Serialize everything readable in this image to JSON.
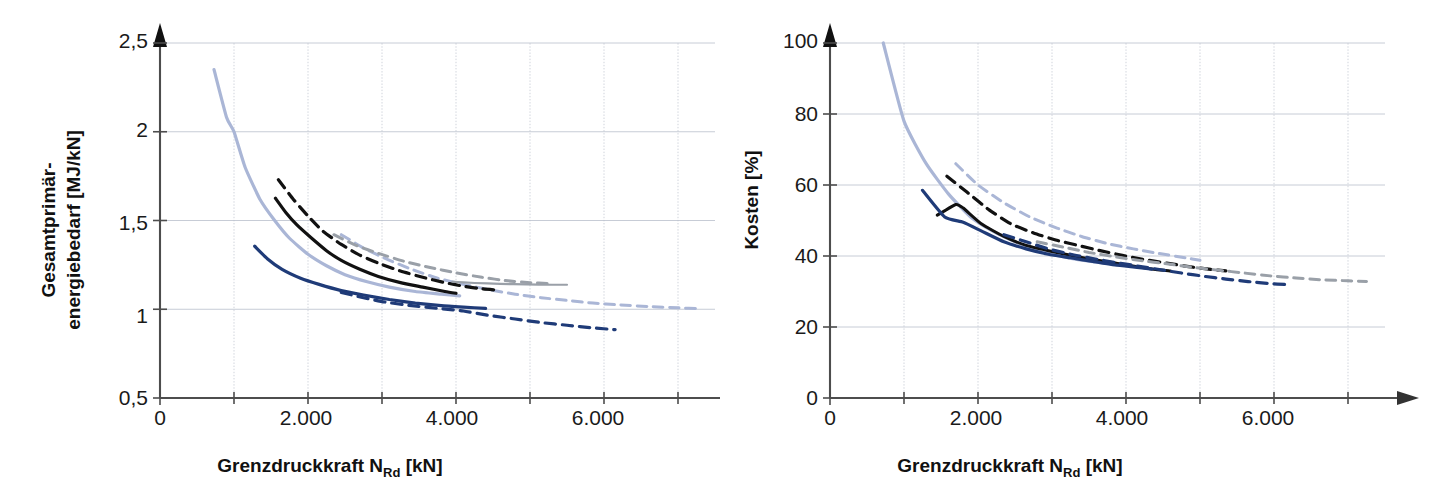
{
  "figure": {
    "background": "#ffffff",
    "panel_count": 2
  },
  "colors": {
    "dark_blue": "#1f3b78",
    "light_blue": "#aab6d6",
    "black": "#111111",
    "gray": "#9aa0a8",
    "grid": "#b9bfcb",
    "axis": "#4d4d4d"
  },
  "chart_data": [
    {
      "id": "left",
      "type": "line",
      "title": "",
      "xlabel": "Grenzdruckkraft N_Rd [kN]",
      "xlabel_main": "Grenzdruckkraft N",
      "xlabel_sub": "Rd",
      "xlabel_unit": " [kN]",
      "ylabel": "Gesamtprimär-energiebedarf [MJ/kN]",
      "ylabel_line1": "Gesamtprimär-",
      "ylabel_line2": "energiebedarf [MJ/kN]",
      "xlim": [
        0,
        7500
      ],
      "ylim": [
        0.5,
        2.5
      ],
      "xticks": [
        0,
        2000,
        4000,
        6000
      ],
      "xtick_labels": [
        "0",
        "2.000",
        "4.000",
        "6.000"
      ],
      "yticks": [
        0.5,
        1,
        1.5,
        2,
        2.5
      ],
      "ytick_labels": [
        "0,5",
        "1",
        "1,5",
        "2",
        "2,5"
      ],
      "x_minor_gridlines": [
        1000,
        2000,
        3000,
        4000,
        5000,
        6000,
        7000
      ],
      "grid": true,
      "legend": "none",
      "series": [
        {
          "name": "light-blue-solid",
          "color": "#aab6d6",
          "style": "solid",
          "width": 3.2,
          "points": [
            [
              730,
              2.35
            ],
            [
              900,
              2.08
            ],
            [
              1000,
              2.0
            ],
            [
              1150,
              1.8
            ],
            [
              1350,
              1.62
            ],
            [
              1550,
              1.5
            ],
            [
              1750,
              1.4
            ],
            [
              2000,
              1.31
            ],
            [
              2250,
              1.245
            ],
            [
              2500,
              1.195
            ],
            [
              2800,
              1.155
            ],
            [
              3100,
              1.125
            ],
            [
              3450,
              1.1
            ],
            [
              3800,
              1.085
            ],
            [
              4050,
              1.075
            ]
          ]
        },
        {
          "name": "light-blue-dashed",
          "color": "#aab6d6",
          "style": "dashed",
          "width": 3.0,
          "points": [
            [
              2450,
              1.42
            ],
            [
              2750,
              1.345
            ],
            [
              3050,
              1.285
            ],
            [
              3400,
              1.225
            ],
            [
              3750,
              1.175
            ],
            [
              4100,
              1.14
            ],
            [
              4450,
              1.11
            ],
            [
              4800,
              1.085
            ],
            [
              5150,
              1.065
            ],
            [
              5500,
              1.05
            ],
            [
              5850,
              1.035
            ],
            [
              6200,
              1.025
            ],
            [
              6600,
              1.015
            ],
            [
              7000,
              1.008
            ],
            [
              7300,
              1.003
            ]
          ]
        },
        {
          "name": "black-solid",
          "color": "#111111",
          "style": "solid",
          "width": 3.2,
          "points": [
            [
              1560,
              1.625
            ],
            [
              1700,
              1.545
            ],
            [
              1850,
              1.475
            ],
            [
              2050,
              1.4
            ],
            [
              2250,
              1.33
            ],
            [
              2450,
              1.275
            ],
            [
              2700,
              1.225
            ],
            [
              2950,
              1.185
            ],
            [
              3250,
              1.15
            ],
            [
              3550,
              1.125
            ],
            [
              3850,
              1.1
            ],
            [
              4000,
              1.09
            ]
          ]
        },
        {
          "name": "black-dashed",
          "color": "#111111",
          "style": "dashed",
          "width": 3.2,
          "points": [
            [
              1600,
              1.73
            ],
            [
              1800,
              1.62
            ],
            [
              2000,
              1.525
            ],
            [
              2200,
              1.44
            ],
            [
              2450,
              1.365
            ],
            [
              2700,
              1.305
            ],
            [
              2950,
              1.26
            ],
            [
              3250,
              1.215
            ],
            [
              3550,
              1.18
            ],
            [
              3850,
              1.15
            ],
            [
              4100,
              1.13
            ],
            [
              4350,
              1.115
            ],
            [
              4550,
              1.108
            ]
          ]
        },
        {
          "name": "gray-dashed",
          "color": "#9aa0a8",
          "style": "dashed",
          "width": 3.0,
          "points": [
            [
              2350,
              1.42
            ],
            [
              2650,
              1.36
            ],
            [
              2950,
              1.315
            ],
            [
              3300,
              1.27
            ],
            [
              3650,
              1.235
            ],
            [
              4000,
              1.205
            ],
            [
              4350,
              1.18
            ],
            [
              4700,
              1.16
            ],
            [
              5000,
              1.15
            ],
            [
              5250,
              1.145
            ]
          ]
        },
        {
          "name": "gray-solid-flat",
          "color": "#9aa0a8",
          "style": "solid",
          "width": 2.2,
          "points": [
            [
              3950,
              1.155
            ],
            [
              4250,
              1.148
            ],
            [
              4600,
              1.143
            ],
            [
              4950,
              1.14
            ],
            [
              5300,
              1.138
            ],
            [
              5500,
              1.138
            ]
          ]
        },
        {
          "name": "dark-blue-solid",
          "color": "#1f3b78",
          "style": "solid",
          "width": 3.2,
          "points": [
            [
              1280,
              1.355
            ],
            [
              1450,
              1.285
            ],
            [
              1650,
              1.225
            ],
            [
              1900,
              1.175
            ],
            [
              2150,
              1.14
            ],
            [
              2450,
              1.105
            ],
            [
              2750,
              1.08
            ],
            [
              3100,
              1.055
            ],
            [
              3450,
              1.035
            ],
            [
              3800,
              1.02
            ],
            [
              4100,
              1.012
            ],
            [
              4400,
              1.005
            ]
          ]
        },
        {
          "name": "dark-blue-dashed",
          "color": "#1f3b78",
          "style": "dashed",
          "width": 3.2,
          "points": [
            [
              2450,
              1.095
            ],
            [
              2750,
              1.065
            ],
            [
              3050,
              1.04
            ],
            [
              3400,
              1.02
            ],
            [
              3750,
              1.005
            ],
            [
              4100,
              0.99
            ],
            [
              4450,
              0.965
            ],
            [
              4800,
              0.945
            ],
            [
              5150,
              0.925
            ],
            [
              5500,
              0.91
            ],
            [
              5850,
              0.895
            ],
            [
              6150,
              0.885
            ]
          ]
        }
      ]
    },
    {
      "id": "right",
      "type": "line",
      "title": "",
      "xlabel": "Grenzdruckkraft N_Rd [kN]",
      "xlabel_main": "Grenzdruckkraft N",
      "xlabel_sub": "Rd",
      "xlabel_unit": " [kN]",
      "ylabel": "Kosten [%]",
      "xlim": [
        0,
        7500
      ],
      "ylim": [
        0,
        100
      ],
      "xticks": [
        0,
        2000,
        4000,
        6000
      ],
      "xtick_labels": [
        "0",
        "2.000",
        "4.000",
        "6.000"
      ],
      "yticks": [
        0,
        20,
        40,
        60,
        80,
        100
      ],
      "ytick_labels": [
        "0",
        "20",
        "40",
        "60",
        "80",
        "100"
      ],
      "x_minor_gridlines": [
        1000,
        2000,
        3000,
        4000,
        5000,
        6000,
        7000
      ],
      "grid": true,
      "legend": "none",
      "series": [
        {
          "name": "light-blue-solid",
          "color": "#aab6d6",
          "style": "solid",
          "width": 3.2,
          "points": [
            [
              720,
              100
            ],
            [
              1000,
              78
            ],
            [
              1300,
              66
            ],
            [
              1600,
              57.5
            ],
            [
              1900,
              51
            ],
            [
              2200,
              47
            ],
            [
              2500,
              44
            ],
            [
              2800,
              41.5
            ],
            [
              3100,
              40
            ],
            [
              3400,
              38.8
            ],
            [
              3700,
              38
            ],
            [
              3950,
              37.5
            ],
            [
              4150,
              37
            ]
          ]
        },
        {
          "name": "light-blue-dashed",
          "color": "#aab6d6",
          "style": "dashed",
          "width": 3.0,
          "points": [
            [
              1700,
              66
            ],
            [
              2000,
              60
            ],
            [
              2350,
              55
            ],
            [
              2700,
              51
            ],
            [
              3050,
              48
            ],
            [
              3400,
              45.5
            ],
            [
              3750,
              43.5
            ],
            [
              4100,
              42
            ],
            [
              4450,
              40.7
            ],
            [
              4800,
              39.5
            ],
            [
              5000,
              38.8
            ]
          ]
        },
        {
          "name": "black-solid",
          "color": "#111111",
          "style": "solid",
          "width": 3.0,
          "points": [
            [
              1450,
              51.5
            ],
            [
              1700,
              54.5
            ],
            [
              1800,
              53.5
            ],
            [
              2050,
              49
            ],
            [
              2350,
              45.5
            ],
            [
              2650,
              43
            ],
            [
              2950,
              41.5
            ],
            [
              3250,
              40.2
            ],
            [
              3550,
              39
            ],
            [
              3850,
              38
            ],
            [
              4150,
              37
            ],
            [
              4400,
              36.2
            ],
            [
              4600,
              35.8
            ]
          ]
        },
        {
          "name": "black-dashed",
          "color": "#111111",
          "style": "dashed",
          "width": 3.2,
          "points": [
            [
              1580,
              62.5
            ],
            [
              1850,
              58
            ],
            [
              2150,
              53
            ],
            [
              2450,
              49
            ],
            [
              2750,
              46.5
            ],
            [
              3050,
              44.5
            ],
            [
              3350,
              43
            ],
            [
              3650,
              41.5
            ],
            [
              3950,
              40.2
            ],
            [
              4250,
              39
            ],
            [
              4550,
              38
            ],
            [
              4850,
              37
            ],
            [
              5150,
              36.2
            ],
            [
              5350,
              35.8
            ]
          ]
        },
        {
          "name": "gray-dashed",
          "color": "#9aa0a8",
          "style": "dashed",
          "width": 3.0,
          "points": [
            [
              2800,
              44
            ],
            [
              3150,
              42.5
            ],
            [
              3500,
              41
            ],
            [
              3850,
              39.8
            ],
            [
              4200,
              38.7
            ],
            [
              4550,
              37.8
            ],
            [
              4900,
              36.8
            ],
            [
              5250,
              36
            ],
            [
              5600,
              35.2
            ],
            [
              5950,
              34.4
            ],
            [
              6300,
              33.8
            ],
            [
              6650,
              33.3
            ],
            [
              7000,
              33.0
            ],
            [
              7250,
              32.8
            ]
          ]
        },
        {
          "name": "dark-blue-solid",
          "color": "#1f3b78",
          "style": "solid",
          "width": 3.2,
          "points": [
            [
              1250,
              58.5
            ],
            [
              1550,
              51
            ],
            [
              1800,
              49.5
            ],
            [
              2050,
              47
            ],
            [
              2350,
              44
            ],
            [
              2650,
              42
            ],
            [
              2950,
              40.5
            ],
            [
              3250,
              39.5
            ],
            [
              3550,
              38.5
            ],
            [
              3850,
              37.5
            ],
            [
              4150,
              36.8
            ],
            [
              4350,
              36.3
            ]
          ]
        },
        {
          "name": "dark-blue-dashed",
          "color": "#1f3b78",
          "style": "dashed",
          "width": 3.2,
          "points": [
            [
              2350,
              46
            ],
            [
              2650,
              44
            ],
            [
              2950,
              42
            ],
            [
              3250,
              40.5
            ],
            [
              3550,
              39.3
            ],
            [
              3850,
              38.2
            ],
            [
              4150,
              37.2
            ],
            [
              4450,
              36.2
            ],
            [
              4750,
              35.2
            ],
            [
              5050,
              34.3
            ],
            [
              5350,
              33.5
            ],
            [
              5650,
              32.8
            ],
            [
              5950,
              32.2
            ],
            [
              6150,
              32.0
            ]
          ]
        }
      ]
    }
  ]
}
